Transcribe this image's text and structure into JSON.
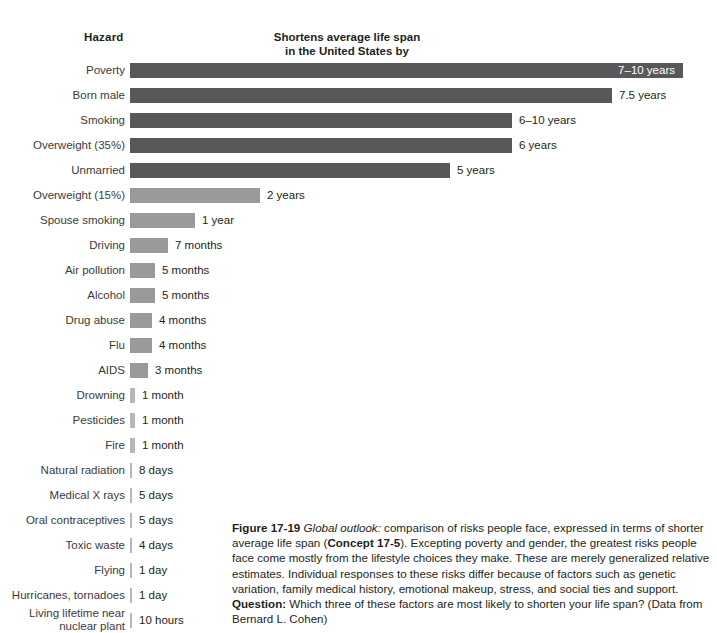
{
  "headers": {
    "hazard": "Hazard",
    "measure_line1": "Shortens average life span",
    "measure_line2": "in the United States by"
  },
  "colors": {
    "bar_dark": "#58585b",
    "bar_light": "#9a9a9c",
    "bar_hairline": "#b7b7ba",
    "text": "#231f20",
    "label_text": "#3b3a3c",
    "background": "#ffffff"
  },
  "chart_data": {
    "type": "bar",
    "title": "Shortens average life span in the United States by",
    "xlabel": "",
    "ylabel": "Hazard",
    "orientation": "horizontal",
    "grid": false,
    "legend": "none",
    "value_unit": "days of shortened life span",
    "categories": [
      "Poverty",
      "Born male",
      "Smoking",
      "Overweight (35%)",
      "Unmarried",
      "Overweight (15%)",
      "Spouse smoking",
      "Driving",
      "Air pollution",
      "Alcohol",
      "Drug abuse",
      "Flu",
      "AIDS",
      "Drowning",
      "Pesticides",
      "Fire",
      "Natural radiation",
      "Medical X rays",
      "Oral contraceptives",
      "Toxic waste",
      "Flying",
      "Hurricanes, tornadoes",
      "Living lifetime near nuclear plant"
    ],
    "value_labels": [
      "7–10 years",
      "7.5 years",
      "6–10 years",
      "6 years",
      "5 years",
      "2 years",
      "1 year",
      "7 months",
      "5 months",
      "5 months",
      "4 months",
      "4 months",
      "3 months",
      "1 month",
      "1 month",
      "1 month",
      "8 days",
      "5 days",
      "5 days",
      "4 days",
      "1 day",
      "1 day",
      "10 hours"
    ],
    "values_days": [
      3285,
      2738,
      2920,
      2190,
      1825,
      730,
      365,
      213,
      152,
      152,
      122,
      122,
      91,
      30,
      30,
      30,
      8,
      5,
      5,
      4,
      1,
      1,
      0.42
    ]
  },
  "rows": [
    {
      "label": "Poverty",
      "value": "7–10 years",
      "bar_px": 553,
      "shade": "dark",
      "label_inside": true,
      "two_line": false
    },
    {
      "label": "Born male",
      "value": "7.5 years",
      "bar_px": 482,
      "shade": "dark",
      "label_inside": false,
      "two_line": false
    },
    {
      "label": "Smoking",
      "value": "6–10 years",
      "bar_px": 382,
      "shade": "dark",
      "label_inside": false,
      "two_line": false
    },
    {
      "label": "Overweight (35%)",
      "value": "6 years",
      "bar_px": 382,
      "shade": "dark",
      "label_inside": false,
      "two_line": false
    },
    {
      "label": "Unmarried",
      "value": "5 years",
      "bar_px": 320,
      "shade": "dark",
      "label_inside": false,
      "two_line": false
    },
    {
      "label": "Overweight (15%)",
      "value": "2 years",
      "bar_px": 130,
      "shade": "light",
      "label_inside": false,
      "two_line": false
    },
    {
      "label": "Spouse smoking",
      "value": "1 year",
      "bar_px": 65,
      "shade": "light",
      "label_inside": false,
      "two_line": false
    },
    {
      "label": "Driving",
      "value": "7 months",
      "bar_px": 38,
      "shade": "light",
      "label_inside": false,
      "two_line": false
    },
    {
      "label": "Air pollution",
      "value": "5 months",
      "bar_px": 25,
      "shade": "light",
      "label_inside": false,
      "two_line": false
    },
    {
      "label": "Alcohol",
      "value": "5 months",
      "bar_px": 25,
      "shade": "light",
      "label_inside": false,
      "two_line": false
    },
    {
      "label": "Drug abuse",
      "value": "4 months",
      "bar_px": 22,
      "shade": "light",
      "label_inside": false,
      "two_line": false
    },
    {
      "label": "Flu",
      "value": "4 months",
      "bar_px": 22,
      "shade": "light",
      "label_inside": false,
      "two_line": false
    },
    {
      "label": "AIDS",
      "value": "3 months",
      "bar_px": 18,
      "shade": "light",
      "label_inside": false,
      "two_line": false
    },
    {
      "label": "Drowning",
      "value": "1 month",
      "bar_px": 5,
      "shade": "hairline",
      "label_inside": false,
      "two_line": false
    },
    {
      "label": "Pesticides",
      "value": "1 month",
      "bar_px": 5,
      "shade": "hairline",
      "label_inside": false,
      "two_line": false
    },
    {
      "label": "Fire",
      "value": "1 month",
      "bar_px": 5,
      "shade": "hairline",
      "label_inside": false,
      "two_line": false
    },
    {
      "label": "Natural radiation",
      "value": "8 days",
      "bar_px": 2,
      "shade": "hairline",
      "label_inside": false,
      "two_line": false
    },
    {
      "label": "Medical X rays",
      "value": "5 days",
      "bar_px": 2,
      "shade": "hairline",
      "label_inside": false,
      "two_line": false
    },
    {
      "label": "Oral contraceptives",
      "value": "5 days",
      "bar_px": 2,
      "shade": "hairline",
      "label_inside": false,
      "two_line": false
    },
    {
      "label": "Toxic waste",
      "value": "4 days",
      "bar_px": 2,
      "shade": "hairline",
      "label_inside": false,
      "two_line": false
    },
    {
      "label": "Flying",
      "value": "1 day",
      "bar_px": 2,
      "shade": "hairline",
      "label_inside": false,
      "two_line": false
    },
    {
      "label": "Hurricanes, tornadoes",
      "value": "1 day",
      "bar_px": 2,
      "shade": "hairline",
      "label_inside": false,
      "two_line": false
    },
    {
      "label": "Living lifetime near\nnuclear plant",
      "value": "10 hours",
      "bar_px": 2,
      "shade": "hairline",
      "label_inside": false,
      "two_line": true
    }
  ],
  "caption": {
    "figure_number": "Figure 17-19",
    "title_italic": "Global outlook:",
    "text_1": " comparison of risks people face, expressed in terms of shorter average life span (",
    "concept": "Concept 17-5",
    "text_2": "). Excepting poverty and gender, the greatest risks people face come mostly from the lifestyle choices they make. These are merely generalized relative estimates. Individual responses to these risks differ because of factors such as genetic variation, family medical history, emotional makeup, stress, and social ties and support. ",
    "question_label": "Question:",
    "text_3": " Which three of these factors are most likely to shorten your life span? (Data from Bernard L. Cohen)"
  }
}
